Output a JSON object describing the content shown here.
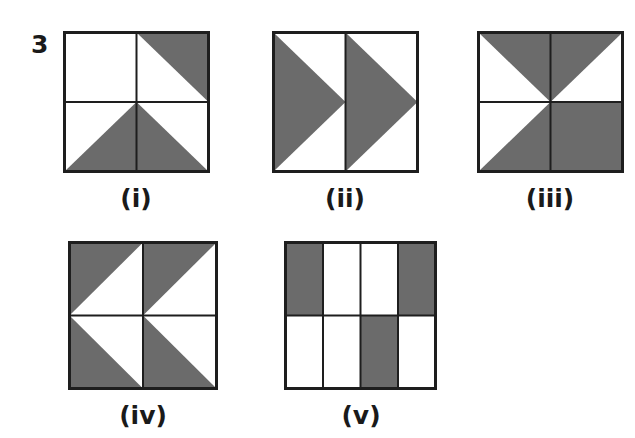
{
  "question": {
    "number": "3"
  },
  "colors": {
    "shade": "#6b6b6b",
    "stroke": "#1e1e1e",
    "background": "#ffffff"
  },
  "figures": [
    {
      "label": "(i)",
      "grid": "2x2",
      "description": "Top-right cell: upper-right triangle shaded; bottom-left cell: lower-right triangle shaded; bottom-right cell: lower-left triangle shaded; top-left blank"
    },
    {
      "label": "(ii)",
      "grid": "1x2",
      "description": "Two right-pointing shaded triangles, one per column"
    },
    {
      "label": "(iii)",
      "grid": "2x2",
      "description": "Top-left: upper-right triangle shaded; top-right: upper-left triangle shaded; bottom-left: lower-right triangle shaded; bottom-right fully shaded"
    },
    {
      "label": "(iv)",
      "grid": "2x2",
      "description": "Top cells: upper-left triangle shaded; bottom cells: lower-left triangle shaded (left-pointing arrows)"
    },
    {
      "label": "(v)",
      "grid": "2x4",
      "description": "Top row: columns 1 and 4 shaded; bottom row: column 3 shaded"
    }
  ]
}
